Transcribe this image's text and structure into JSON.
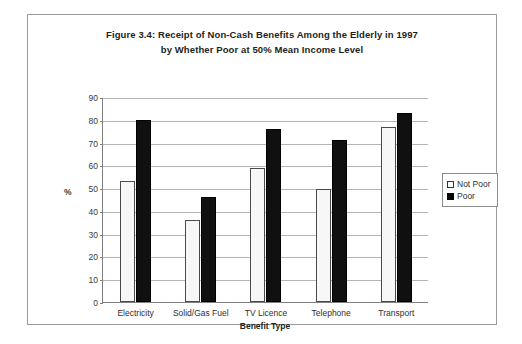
{
  "chart_data": {
    "type": "bar",
    "title": "Figure 3.4: Receipt of Non-Cash Benefits Among the Elderly in 1997 by Whether Poor at 50% Mean Income Level",
    "title_lines": [
      "Figure 3.4: Receipt of Non-Cash Benefits Among the Elderly in 1997",
      "by Whether Poor at 50% Mean Income Level"
    ],
    "categories": [
      "Electricity",
      "Solid/Gas Fuel",
      "TV Licence",
      "Telephone",
      "Transport"
    ],
    "series": [
      {
        "name": "Not Poor",
        "values": [
          53,
          36,
          59,
          49.5,
          77
        ],
        "color": "#f7f7f7"
      },
      {
        "name": "Poor",
        "values": [
          80,
          46,
          76,
          71,
          83
        ],
        "color": "#000000"
      }
    ],
    "xlabel": "Benefit Type",
    "ylabel": "%",
    "ylim": [
      0,
      90
    ],
    "ytick_values": [
      0,
      10,
      20,
      30,
      40,
      50,
      60,
      70,
      80,
      90
    ],
    "ytick_labels": [
      "0",
      "10",
      "20",
      "30",
      "40",
      "50",
      "60",
      "70",
      "80",
      "90"
    ],
    "grid": true,
    "legend_position": "right"
  },
  "legend": {
    "entries": [
      {
        "label": "Not Poor",
        "swatch": "hollow-square-swatch"
      },
      {
        "label": "Poor",
        "swatch": "filled-square-swatch"
      }
    ]
  }
}
